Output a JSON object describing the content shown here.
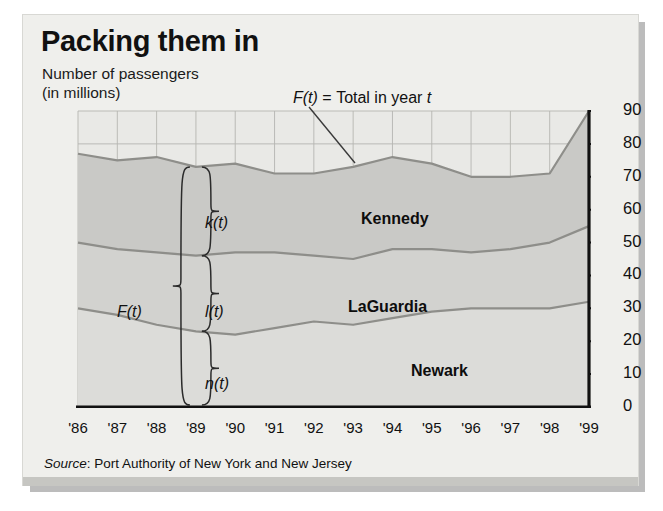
{
  "header": {
    "title": "Packing them in",
    "subtitle_line1": "Number of passengers",
    "subtitle_line2": "(in millions)"
  },
  "callout": {
    "func": "F(t)",
    "equals": "=",
    "text": "Total in year",
    "var": "t"
  },
  "braces": {
    "outer_label": "F(t)",
    "kennedy_label": "k(t)",
    "laguardia_label": "l(t)",
    "newark_label": "n(t)"
  },
  "layer_labels": {
    "kennedy": "Kennedy",
    "laguardia": "LaGuardia",
    "newark": "Newark"
  },
  "source": {
    "prefix": "Source",
    "text": ": Port Authority of New York and New Jersey"
  },
  "colors": {
    "card_background": "#efefec",
    "kennedy_fill": "#c9c9c6",
    "laguardia_fill": "#d2d2cf",
    "newark_fill": "#dcdcd9",
    "line": "#8e8e8a",
    "axis": "#111111",
    "grid": "#b5b5b1",
    "shadow": "#bcbcbc"
  },
  "chart_data": {
    "type": "area",
    "title": "Packing them in",
    "subtitle": "Number of passengers (in millions)",
    "xlabel": "",
    "ylabel": "Number of passengers (in millions)",
    "stacked": true,
    "grid": true,
    "legend": "inline-layer-labels",
    "xlim": [
      1986,
      1999
    ],
    "ylim": [
      0,
      90
    ],
    "yticks": [
      0,
      10,
      20,
      30,
      40,
      50,
      60,
      70,
      80,
      90
    ],
    "ytick_labels": [
      "0",
      "10",
      "20",
      "30",
      "40",
      "50",
      "60",
      "70",
      "80",
      "90"
    ],
    "x": [
      1986,
      1987,
      1988,
      1989,
      1990,
      1991,
      1992,
      1993,
      1994,
      1995,
      1996,
      1997,
      1998,
      1999
    ],
    "xtick_labels": [
      "'86",
      "'87",
      "'88",
      "'89",
      "'90",
      "'91",
      "'92",
      "'93",
      "'94",
      "'95",
      "'96",
      "'97",
      "'98",
      "'99"
    ],
    "series": [
      {
        "name": "Newark",
        "symbol": "n(t)",
        "order": 0,
        "values": [
          30,
          28,
          25,
          23,
          22,
          24,
          26,
          25,
          27,
          29,
          30,
          30,
          30,
          32
        ]
      },
      {
        "name": "LaGuardia",
        "symbol": "l(t)",
        "order": 1,
        "values": [
          20,
          20,
          22,
          23,
          25,
          23,
          20,
          20,
          21,
          19,
          17,
          18,
          20,
          23
        ]
      },
      {
        "name": "Kennedy",
        "symbol": "k(t)",
        "order": 2,
        "values": [
          27,
          27,
          29,
          27,
          27,
          24,
          25,
          28,
          28,
          26,
          23,
          22,
          21,
          35
        ]
      }
    ],
    "cumulative_boundaries": {
      "newark_top": [
        30,
        28,
        25,
        23,
        22,
        24,
        26,
        25,
        27,
        29,
        30,
        30,
        30,
        32
      ],
      "laguardia_top": [
        50,
        48,
        47,
        46,
        47,
        47,
        46,
        45,
        48,
        48,
        47,
        48,
        50,
        55
      ],
      "total_top": [
        77,
        75,
        76,
        73,
        74,
        71,
        71,
        73,
        76,
        74,
        70,
        70,
        71,
        90
      ]
    },
    "total": {
      "name": "F(t) = Total in year t",
      "values": [
        77,
        75,
        76,
        73,
        74,
        71,
        71,
        73,
        76,
        74,
        70,
        70,
        71,
        90
      ]
    },
    "annotations": [
      {
        "text": "F(t) = Total in year t",
        "points_to_year": 1994
      },
      {
        "text": "k(t)",
        "describes": "Kennedy",
        "at_year": 1989
      },
      {
        "text": "l(t)",
        "describes": "LaGuardia",
        "at_year": 1989
      },
      {
        "text": "n(t)",
        "describes": "Newark",
        "at_year": 1989
      },
      {
        "text": "F(t)",
        "describes": "Total",
        "at_year": 1989
      }
    ]
  }
}
